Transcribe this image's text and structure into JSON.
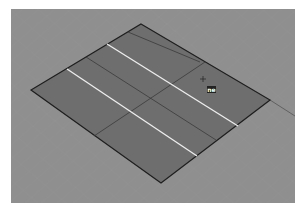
{
  "viewport": {
    "name": "Perspective",
    "background": "#8f8f8f",
    "plane_fill": "#6f6f6f",
    "edge_color": "#1e1e1e",
    "highlight_color": "#f0f0f0",
    "cursor_label": "ne"
  }
}
